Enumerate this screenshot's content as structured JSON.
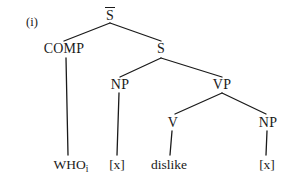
{
  "figure": {
    "example_label": "(i)",
    "type": "syntax-tree"
  },
  "tree": {
    "nodes": [
      {
        "id": "sbar",
        "label": "S",
        "overline": true,
        "x": 110,
        "y": 8,
        "kind": "nonterminal"
      },
      {
        "id": "comp",
        "label": "COMP",
        "overline": false,
        "x": 64,
        "y": 42,
        "kind": "nonterminal"
      },
      {
        "id": "s",
        "label": "S",
        "overline": false,
        "x": 161,
        "y": 42,
        "kind": "nonterminal"
      },
      {
        "id": "np1",
        "label": "NP",
        "overline": false,
        "x": 120,
        "y": 78,
        "kind": "nonterminal"
      },
      {
        "id": "vp",
        "label": "VP",
        "overline": false,
        "x": 222,
        "y": 78,
        "kind": "nonterminal"
      },
      {
        "id": "v",
        "label": "V",
        "overline": false,
        "x": 173,
        "y": 116,
        "kind": "nonterminal"
      },
      {
        "id": "np2",
        "label": "NP",
        "overline": false,
        "x": 268,
        "y": 116,
        "kind": "nonterminal"
      }
    ],
    "terminals": [
      {
        "id": "who",
        "label": "WHO",
        "subscript": "i",
        "x": 71,
        "y": 158
      },
      {
        "id": "trace1",
        "label": "[x]",
        "subscript": "",
        "x": 117,
        "y": 158
      },
      {
        "id": "dislike",
        "label": "dislike",
        "subscript": "",
        "x": 169,
        "y": 158
      },
      {
        "id": "trace2",
        "label": "[x]",
        "subscript": "",
        "x": 267,
        "y": 158
      }
    ],
    "edges": [
      {
        "id": "sbar-comp",
        "from": "sbar",
        "to": "comp",
        "x1": 110,
        "y1": 23,
        "x2": 64,
        "y2": 41
      },
      {
        "id": "sbar-s",
        "from": "sbar",
        "to": "s",
        "x1": 110,
        "y1": 23,
        "x2": 161,
        "y2": 41
      },
      {
        "id": "comp-who",
        "from": "comp",
        "to": "who",
        "x1": 66,
        "y1": 58,
        "x2": 68,
        "y2": 155
      },
      {
        "id": "s-np1",
        "from": "s",
        "to": "np1",
        "x1": 161,
        "y1": 58,
        "x2": 120,
        "y2": 77
      },
      {
        "id": "s-vp",
        "from": "s",
        "to": "vp",
        "x1": 161,
        "y1": 58,
        "x2": 222,
        "y2": 77
      },
      {
        "id": "np1-trace1",
        "from": "np1",
        "to": "trace1",
        "x1": 119,
        "y1": 93,
        "x2": 117,
        "y2": 155
      },
      {
        "id": "vp-v",
        "from": "vp",
        "to": "v",
        "x1": 222,
        "y1": 93,
        "x2": 175,
        "y2": 114
      },
      {
        "id": "vp-np2",
        "from": "vp",
        "to": "np2",
        "x1": 222,
        "y1": 93,
        "x2": 266,
        "y2": 114
      },
      {
        "id": "v-dislike",
        "from": "v",
        "to": "dislike",
        "x1": 172,
        "y1": 131,
        "x2": 170,
        "y2": 155
      },
      {
        "id": "np2-trace2",
        "from": "np2",
        "to": "trace2",
        "x1": 267,
        "y1": 131,
        "x2": 266,
        "y2": 155
      }
    ]
  },
  "colors": {
    "ink": "#1a1a1a",
    "background": "#ffffff"
  }
}
